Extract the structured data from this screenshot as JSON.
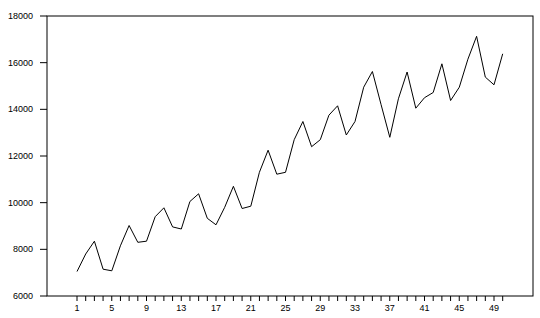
{
  "chart_data": {
    "type": "line",
    "title": "",
    "xlabel": "",
    "ylabel": "",
    "ylim": [
      6000,
      18000
    ],
    "xlim": [
      1,
      50
    ],
    "grid": false,
    "legend": null,
    "y_ticks": [
      6000,
      8000,
      10000,
      12000,
      14000,
      16000,
      18000
    ],
    "x_tick_labels": [
      1,
      5,
      9,
      13,
      17,
      21,
      25,
      29,
      33,
      37,
      41,
      45,
      49
    ],
    "x": [
      1,
      2,
      3,
      4,
      5,
      6,
      7,
      8,
      9,
      10,
      11,
      12,
      13,
      14,
      15,
      16,
      17,
      18,
      19,
      20,
      21,
      22,
      23,
      24,
      25,
      26,
      27,
      28,
      29,
      30,
      31,
      32,
      33,
      34,
      35,
      36,
      37,
      38,
      39,
      40,
      41,
      42,
      43,
      44,
      45,
      46,
      47,
      48,
      49,
      50
    ],
    "series": [
      {
        "name": "series1",
        "color": "#000000",
        "values": [
          7050,
          7800,
          8350,
          7150,
          7080,
          8150,
          9020,
          8300,
          8350,
          9400,
          9780,
          8960,
          8870,
          10050,
          10380,
          9330,
          9050,
          9800,
          10700,
          9750,
          9850,
          11300,
          12250,
          11220,
          11300,
          12700,
          13480,
          12400,
          12700,
          13750,
          14150,
          12900,
          13480,
          14950,
          15620,
          14200,
          12800,
          14450,
          15600,
          14050,
          14500,
          14720,
          15950,
          14380,
          14950,
          16150,
          17130,
          15380,
          15050,
          16380
        ]
      }
    ]
  }
}
